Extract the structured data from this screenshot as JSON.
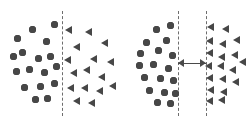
{
  "figure": {
    "background_color": "#ffffff",
    "marker_color": "#474747",
    "divider_color": "#6d6d6d",
    "arrow_color": "#4a4a4a",
    "width": 249,
    "height": 124
  },
  "chart_data": {
    "type": "scatter",
    "subtitle": "",
    "xlabel": "",
    "ylabel": "",
    "xlim": [
      0,
      249
    ],
    "ylim": [
      0,
      124
    ],
    "grid": false,
    "legend": null,
    "annotations": [
      {
        "name": "gap-arrow",
        "type": "double-headed-arrow",
        "panel": "right",
        "x_start": 178,
        "x_end": 206,
        "y": 63,
        "label": ""
      }
    ],
    "panels": [
      {
        "name": "panel-left",
        "label": "",
        "dividers": [
          {
            "name": "divider-center",
            "x": 62,
            "y_top": 11,
            "y_bottom": 116,
            "style": "dashed"
          }
        ],
        "series": [
          {
            "name": "circles",
            "marker": "circle",
            "color": "#474747",
            "size": 7,
            "points": [
              [
                17,
                38
              ],
              [
                32,
                29
              ],
              [
                46,
                41
              ],
              [
                54,
                24
              ],
              [
                22,
                52
              ],
              [
                38,
                58
              ],
              [
                29,
                69
              ],
              [
                50,
                56
              ],
              [
                16,
                71
              ],
              [
                44,
                72
              ],
              [
                56,
                66
              ],
              [
                24,
                87
              ],
              [
                40,
                86
              ],
              [
                54,
                83
              ],
              [
                35,
                99
              ],
              [
                13,
                56
              ],
              [
                47,
                98
              ]
            ]
          },
          {
            "name": "triangles",
            "marker": "triangle-left",
            "color": "#474747",
            "size": 7,
            "points": [
              [
                68,
                30
              ],
              [
                88,
                32
              ],
              [
                104,
                43
              ],
              [
                76,
                47
              ],
              [
                67,
                60
              ],
              [
                93,
                59
              ],
              [
                110,
                62
              ],
              [
                73,
                73
              ],
              [
                86,
                70
              ],
              [
                101,
                77
              ],
              [
                70,
                88
              ],
              [
                84,
                88
              ],
              [
                99,
                91
              ],
              [
                112,
                86
              ],
              [
                76,
                101
              ],
              [
                91,
                103
              ]
            ]
          }
        ]
      },
      {
        "name": "panel-right",
        "label": "",
        "dividers": [
          {
            "name": "divider-left",
            "x": 178,
            "y_top": 11,
            "y_bottom": 116,
            "style": "dashed"
          },
          {
            "name": "divider-right",
            "x": 206,
            "y_top": 11,
            "y_bottom": 116,
            "style": "dashed"
          }
        ],
        "series": [
          {
            "name": "circles",
            "marker": "circle",
            "color": "#474747",
            "size": 7,
            "points": [
              [
                156,
                29
              ],
              [
                170,
                25
              ],
              [
                146,
                42
              ],
              [
                166,
                40
              ],
              [
                140,
                53
              ],
              [
                158,
                50
              ],
              [
                172,
                55
              ],
              [
                139,
                65
              ],
              [
                153,
                64
              ],
              [
                168,
                68
              ],
              [
                144,
                77
              ],
              [
                160,
                78
              ],
              [
                173,
                80
              ],
              [
                149,
                90
              ],
              [
                164,
                92
              ],
              [
                175,
                93
              ],
              [
                157,
                102
              ],
              [
                170,
                103
              ]
            ]
          },
          {
            "name": "triangles",
            "marker": "triangle-left",
            "color": "#474747",
            "size": 7,
            "points": [
              [
                210,
                27
              ],
              [
                225,
                29
              ],
              [
                209,
                41
              ],
              [
                222,
                44
              ],
              [
                236,
                40
              ],
              [
                209,
                53
              ],
              [
                221,
                57
              ],
              [
                234,
                55
              ],
              [
                208,
                66
              ],
              [
                220,
                66
              ],
              [
                232,
                70
              ],
              [
                242,
                62
              ],
              [
                209,
                78
              ],
              [
                222,
                79
              ],
              [
                235,
                82
              ],
              [
                210,
                90
              ],
              [
                223,
                92
              ],
              [
                209,
                101
              ],
              [
                221,
                100
              ]
            ]
          }
        ]
      }
    ]
  }
}
